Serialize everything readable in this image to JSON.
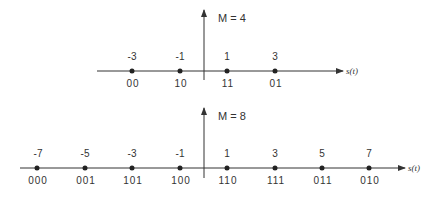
{
  "diagrams": [
    {
      "title": "M = 4",
      "axis_label": "s(t)",
      "points": [
        {
          "value": "-3",
          "code": "00"
        },
        {
          "value": "-1",
          "code": "10"
        },
        {
          "value": "1",
          "code": "11"
        },
        {
          "value": "3",
          "code": "01"
        }
      ]
    },
    {
      "title": "M = 8",
      "axis_label": "s(t)",
      "points": [
        {
          "value": "-7",
          "code": "000"
        },
        {
          "value": "-5",
          "code": "001"
        },
        {
          "value": "-3",
          "code": "101"
        },
        {
          "value": "-1",
          "code": "100"
        },
        {
          "value": "1",
          "code": "110"
        },
        {
          "value": "3",
          "code": "111"
        },
        {
          "value": "5",
          "code": "011"
        },
        {
          "value": "7",
          "code": "010"
        }
      ]
    }
  ],
  "colors": {
    "line": "#333333",
    "text": "#333333",
    "background": "#ffffff"
  }
}
